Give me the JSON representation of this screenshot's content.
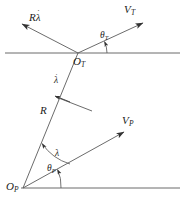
{
  "figure": {
    "kind": "geometry-diagram",
    "stroke_color": "#4a4a4a",
    "text_color": "#1c1c1c",
    "background_color": "#ffffff",
    "width": 184,
    "height": 212
  },
  "points": {
    "target_origin": {
      "label": "O",
      "subscript": "T",
      "x": 78,
      "y": 53
    },
    "pursuer_origin": {
      "label": "O",
      "subscript": "P",
      "x": 23,
      "y": 188
    }
  },
  "vectors": {
    "target_velocity": {
      "label": "V",
      "subscript": "T",
      "tail_x": 78,
      "tail_y": 53,
      "tip_x": 147,
      "tip_y": 21,
      "label_x": 126,
      "label_y": 7
    },
    "los_rate_velocity": {
      "label": "R",
      "lambda": "λ",
      "dot": "˙",
      "tail_x": 78,
      "tail_y": 53,
      "tip_x": 17,
      "tip_y": 22,
      "label_x": 31,
      "label_y": 17
    },
    "pursuer_velocity": {
      "label": "V",
      "subscript": "P",
      "tail_x": 23,
      "tail_y": 188,
      "tip_x": 127,
      "tip_y": 130,
      "label_x": 124,
      "label_y": 118
    },
    "los_rate_perpendicular": {
      "label": "λ",
      "dot": "˙",
      "tail_x": 87,
      "tail_y": 107,
      "tip_x": 56,
      "tip_y": 96,
      "label_x": 57,
      "label_y": 80
    }
  },
  "segments": {
    "range_line": {
      "label": "R",
      "from_x": 23,
      "from_y": 188,
      "to_x": 78,
      "to_y": 53,
      "label_x": 42,
      "label_y": 111
    },
    "top_horizontal": {
      "x1": 5,
      "y1": 53,
      "x2": 180,
      "y2": 53
    },
    "bottom_horizontal": {
      "x1": 21,
      "y1": 188,
      "x2": 180,
      "y2": 188
    }
  },
  "angles": {
    "theta_target": {
      "label": "θ",
      "subscript": "T",
      "label_x": 103,
      "label_y": 37,
      "vertex_x": 78,
      "vertex_y": 53,
      "radius": 29
    },
    "theta_pursuer": {
      "label": "θ",
      "subscript": "P",
      "label_x": 50,
      "label_y": 169,
      "vertex_x": 23,
      "vertex_y": 188,
      "radius": 38
    },
    "lambda_pursuer": {
      "label": "λ",
      "label_x": 57,
      "label_y": 154,
      "vertex_x": 23,
      "vertex_y": 188,
      "radius": 52
    }
  },
  "caption": {
    "text": ""
  }
}
